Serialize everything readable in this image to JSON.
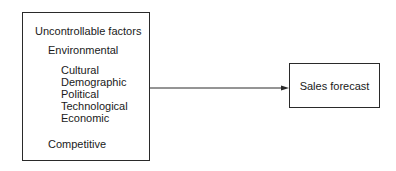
{
  "diagram": {
    "left_box": {
      "title": "Uncontrollable factors",
      "groups": [
        {
          "label": "Environmental",
          "items": [
            "Cultural",
            "Demographic",
            "Political",
            "Technological",
            "Economic"
          ]
        },
        {
          "label": "Competitive",
          "items": []
        }
      ]
    },
    "right_box": {
      "label": "Sales forecast"
    },
    "arrow": {
      "from": "Uncontrollable factors",
      "to": "Sales forecast",
      "color": "#2a2a2a"
    }
  }
}
